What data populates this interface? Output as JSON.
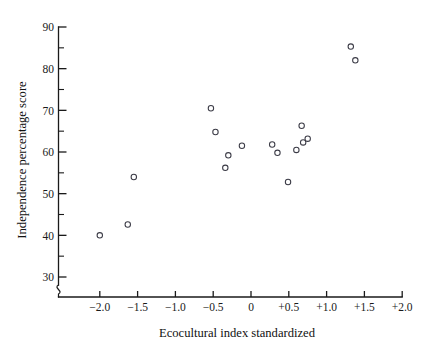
{
  "chart_data": {
    "type": "scatter",
    "title": "",
    "xlabel": "Ecocultural index standardized",
    "ylabel": "Independence percentage score",
    "xlim": [
      -2.35,
      2.0
    ],
    "ylim": [
      27.5,
      90
    ],
    "grid": false,
    "legend": null,
    "marker_style": "open-circle",
    "axis_break": {
      "axis": "y",
      "below_value": 30,
      "symbol": "zigzag"
    },
    "xticks": [
      -2.0,
      -1.5,
      -1.0,
      -0.5,
      0,
      0.5,
      1.0,
      1.5,
      2.0
    ],
    "xtick_labels": [
      "−2.0",
      "−1.5",
      "−1.0",
      "−0.5",
      "0",
      "+0.5",
      "+1.0",
      "+1.5",
      "+2.0"
    ],
    "yticks": [
      30,
      40,
      50,
      60,
      70,
      80,
      90
    ],
    "ytick_labels": [
      "30",
      "40",
      "50",
      "60",
      "70",
      "80",
      "90"
    ],
    "y_minor_ticks": [
      35,
      45,
      55,
      65,
      75,
      85
    ],
    "n_points": 17,
    "points": [
      {
        "x": -2.0,
        "y": 40.0
      },
      {
        "x": -1.63,
        "y": 42.6
      },
      {
        "x": -1.55,
        "y": 54.0
      },
      {
        "x": -0.53,
        "y": 70.5
      },
      {
        "x": -0.47,
        "y": 64.8
      },
      {
        "x": -0.34,
        "y": 56.2
      },
      {
        "x": -0.3,
        "y": 59.2
      },
      {
        "x": -0.12,
        "y": 61.5
      },
      {
        "x": 0.28,
        "y": 61.8
      },
      {
        "x": 0.35,
        "y": 59.8
      },
      {
        "x": 0.49,
        "y": 52.8
      },
      {
        "x": 0.6,
        "y": 60.5
      },
      {
        "x": 0.67,
        "y": 66.3
      },
      {
        "x": 0.69,
        "y": 62.3
      },
      {
        "x": 0.75,
        "y": 63.2
      },
      {
        "x": 1.32,
        "y": 85.3
      },
      {
        "x": 1.38,
        "y": 82.0
      }
    ]
  },
  "style": {
    "marker_color": "#3b3b46",
    "axis_color": "#1a1a1a",
    "background": "#ffffff"
  }
}
